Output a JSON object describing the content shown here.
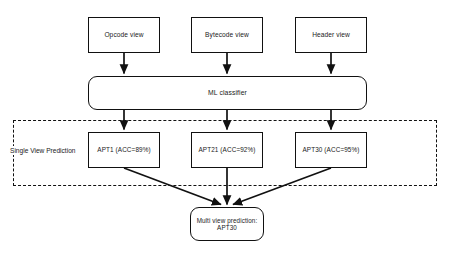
{
  "diagram": {
    "colors": {
      "stroke": "#111111",
      "fill": "#ffffff",
      "text": "#1a1a1a"
    },
    "input_views": [
      {
        "id": "opcode-view",
        "label": "Opcode view"
      },
      {
        "id": "bytecode-view",
        "label": "Bytecode view"
      },
      {
        "id": "header-view",
        "label": "Header view"
      }
    ],
    "classifier": {
      "id": "ml-classifier",
      "label": "ML classifier"
    },
    "group": {
      "id": "single-view-prediction",
      "label": "Single View Prediction",
      "border_style": "dashed"
    },
    "single_view_predictions": [
      {
        "id": "apt1",
        "label": "APT1 (ACC=89%)",
        "class": "APT1",
        "accuracy": "89%"
      },
      {
        "id": "apt21",
        "label": "APT21 (ACC=92%)",
        "class": "APT21",
        "accuracy": "92%"
      },
      {
        "id": "apt30",
        "label": "APT30 (ACC=95%)",
        "class": "APT30",
        "accuracy": "95%"
      }
    ],
    "final_prediction": {
      "id": "multi-view-prediction",
      "line1": "Multi view prediction:",
      "line2": "APT30"
    }
  }
}
